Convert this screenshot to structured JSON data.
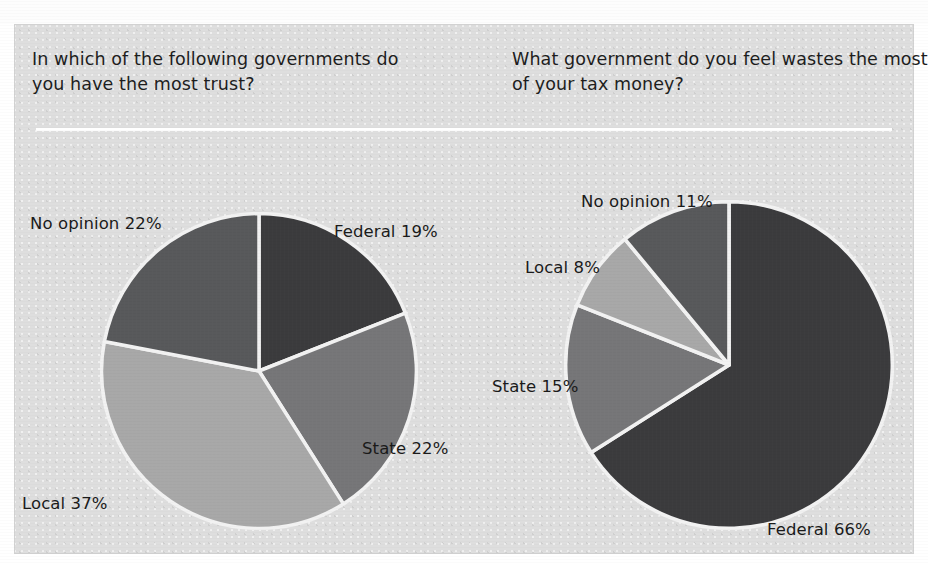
{
  "bleed": {
    "clipped_line": "by any of these people in managing the government?",
    "corner_mark": "◇"
  },
  "panel": {
    "background_color": "#dedede",
    "rule_color": "#ffffff"
  },
  "charts": {
    "left": {
      "heading": "In which of the following governments do\nyou have the most trust?",
      "labels": {
        "federal": "Federal 19%",
        "state": "State 22%",
        "local": "Local 37%",
        "no_opinion": "No opinion 22%"
      }
    },
    "right": {
      "heading": "What government do you feel wastes the most\nof your tax money?",
      "labels": {
        "federal": "Federal 66%",
        "state": "State 15%",
        "local": "Local 8%",
        "no_opinion": "No opinion 11%"
      }
    }
  },
  "palette": {
    "federal": "#3b3b3d",
    "state": "#767678",
    "local": "#a8a8a8",
    "no_opinion": "#58595b",
    "slice_divider": "#f2f2f2"
  },
  "chart_data": [
    {
      "type": "pie",
      "title": "In which of the following governments do you have the most trust?",
      "categories": [
        "Federal",
        "State",
        "Local",
        "No opinion"
      ],
      "values": [
        19,
        22,
        37,
        22
      ],
      "value_unit": "percent",
      "data_labels": [
        "Federal 19%",
        "State 22%",
        "Local 37%",
        "No opinion 22%"
      ],
      "colors": [
        "#3b3b3d",
        "#767678",
        "#a8a8a8",
        "#58595b"
      ],
      "start_angle_deg": 0,
      "direction": "clockwise",
      "legend": "none",
      "grid": false
    },
    {
      "type": "pie",
      "title": "What government do you feel wastes the most of your tax money?",
      "categories": [
        "Federal",
        "State",
        "Local",
        "No opinion"
      ],
      "values": [
        66,
        15,
        8,
        11
      ],
      "value_unit": "percent",
      "data_labels": [
        "Federal 66%",
        "State 15%",
        "Local 8%",
        "No opinion 11%"
      ],
      "colors": [
        "#3b3b3d",
        "#767678",
        "#a8a8a8",
        "#58595b"
      ],
      "start_angle_deg": 0,
      "direction": "clockwise",
      "legend": "none",
      "grid": false
    }
  ]
}
